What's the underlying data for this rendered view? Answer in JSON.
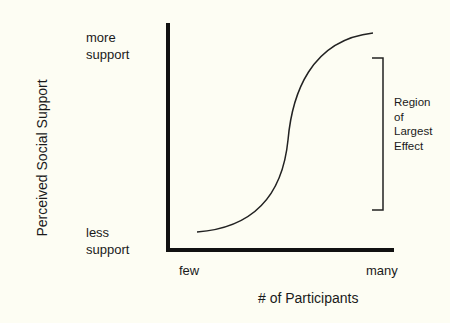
{
  "diagram": {
    "y_axis_label": "Perceived Social Support",
    "x_axis_label": "# of Participants",
    "y_ticks": {
      "top_line1": "more",
      "top_line2": "support",
      "bottom_line1": "less",
      "bottom_line2": "support"
    },
    "x_ticks": {
      "left": "few",
      "right": "many"
    },
    "annotation": {
      "line1": "Region",
      "line2": "of",
      "line3": "Largest",
      "line4": "Effect"
    },
    "curve_type": "sigmoid",
    "colors": {
      "background": "#fdfdf3",
      "ink": "#1a1a1a"
    }
  }
}
